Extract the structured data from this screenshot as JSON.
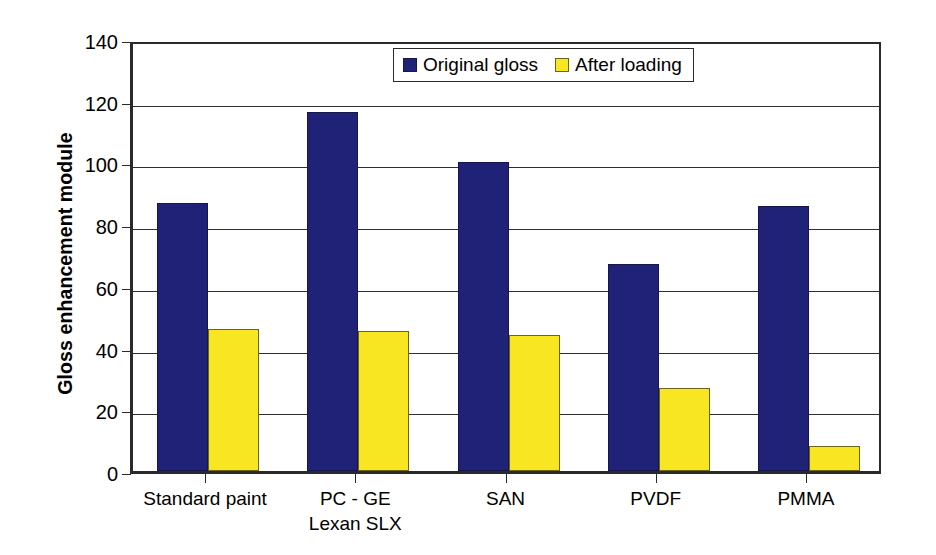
{
  "chart_data": {
    "type": "bar",
    "title": "",
    "xlabel": "",
    "ylabel": "Gloss enhancement module",
    "ylim": [
      0,
      140
    ],
    "ytick_step": 20,
    "yticks": [
      0,
      20,
      40,
      60,
      80,
      100,
      120,
      140
    ],
    "grid": true,
    "legend_position": "top-center",
    "categories": [
      "Standard paint",
      "PC - GE\nLexan SLX",
      "SAN",
      "PVDF",
      "PMMA"
    ],
    "series": [
      {
        "name": "Original gloss",
        "color": "#1f2277",
        "values": [
          87,
          116.5,
          100,
          67,
          86
        ]
      },
      {
        "name": "After loading",
        "color": "#f7e621",
        "values": [
          46,
          45.5,
          44,
          27,
          8
        ]
      }
    ]
  },
  "legend": {
    "items": [
      {
        "label": "Original gloss",
        "swatch": "blue-square-icon"
      },
      {
        "label": "After loading",
        "swatch": "yellow-square-icon"
      }
    ]
  },
  "colors": {
    "original_gloss": "#1f2277",
    "after_loading": "#f7e621",
    "axis": "#2a2a2a",
    "background": "#ffffff"
  }
}
